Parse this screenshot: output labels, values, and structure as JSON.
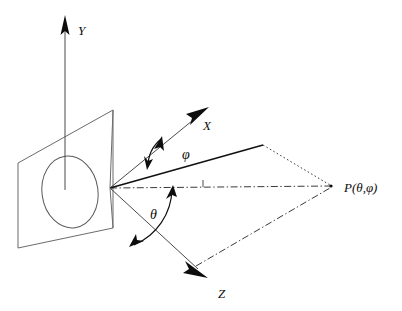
{
  "figure": {
    "title": "",
    "background_color": "#ffffff",
    "line_color": "#4a4a4a",
    "accent_color": "#0d0d0d",
    "width": 402,
    "height": 311
  },
  "axes": [
    {
      "id": "y-axis",
      "label": "Y",
      "direction": "up",
      "origin": [
        65,
        190
      ],
      "tip": [
        65,
        18
      ],
      "label_pos": [
        78,
        33
      ]
    },
    {
      "id": "x-axis",
      "label": "X",
      "direction": "up-right",
      "origin": [
        110,
        188
      ],
      "tip": [
        208,
        108
      ],
      "label_pos": [
        205,
        127
      ]
    },
    {
      "id": "z-axis",
      "label": "Z",
      "direction": "down-right",
      "origin": [
        110,
        188
      ],
      "tip": [
        207,
        277
      ],
      "label_pos": [
        218,
        295
      ]
    }
  ],
  "angles": [
    {
      "id": "phi",
      "label": "φ",
      "label_pos": [
        186,
        155
      ],
      "description": "azimuth between X axis and radial line to P"
    },
    {
      "id": "theta",
      "label": "θ",
      "label_pos": [
        154,
        215
      ],
      "description": "polar angle between horizontal reference axis and Z direction"
    }
  ],
  "points": [
    {
      "id": "point-p",
      "label": "P(θ,φ)",
      "position": [
        333,
        187
      ],
      "label_pos": [
        345,
        192
      ]
    },
    {
      "id": "origin",
      "label": "",
      "position": [
        110,
        188
      ]
    }
  ],
  "plane": {
    "id": "reference-plane",
    "corners": [
      [
        18,
        163
      ],
      [
        113,
        110
      ],
      [
        113,
        228
      ],
      [
        18,
        248
      ]
    ],
    "stroke": "#6b6b6b"
  },
  "ellipse": {
    "id": "beam-ellipse",
    "center": [
      70,
      192
    ],
    "rx": 28,
    "ry": 36,
    "rotation": -8,
    "stroke": "#5a5a5a"
  },
  "rays": [
    {
      "id": "radial-solid",
      "style": "solid",
      "from": [
        110,
        188
      ],
      "to": [
        263,
        145
      ]
    },
    {
      "id": "radial-dotted-to-p",
      "style": "dotted",
      "from": [
        263,
        145
      ],
      "to": [
        331,
        186
      ]
    },
    {
      "id": "horizontal-dashdot-axis",
      "style": "dash-dot",
      "from": [
        110,
        188
      ],
      "to": [
        331,
        186
      ]
    },
    {
      "id": "ground-dashdot-to-p",
      "style": "dash-dot",
      "from": [
        196,
        266
      ],
      "to": [
        331,
        187
      ]
    }
  ],
  "tick": {
    "id": "axis-tick",
    "position": [
      203,
      183
    ],
    "length": 6
  }
}
